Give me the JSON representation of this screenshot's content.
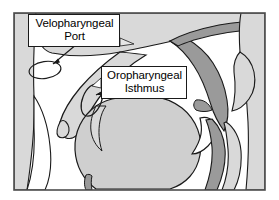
{
  "figure": {
    "frame_color": "#4d4d4d",
    "background_color": "#ffffff"
  },
  "palette": {
    "tissue_light": "#d9d9d9",
    "tissue_mid": "#c9c9c9",
    "tissue_dark": "#9a9a9a",
    "airway_white": "#ffffff",
    "outline": "#1a1a1a",
    "label_text": "#000000",
    "label_border": "#1a1a1a",
    "label_fill": "#ffffff"
  },
  "callouts": [
    {
      "id": "velopharyngeal-port",
      "line1": "Velopharyngeal",
      "line2": "Port"
    },
    {
      "id": "oropharyngeal-isthmus",
      "line1": "Oropharyngeal",
      "line2": "Isthmus"
    }
  ],
  "markers": {
    "velopharyngeal_port_ellipse": "ellipse",
    "oropharyngeal_isthmus_ellipse": "ellipse",
    "velopharyngeal_port_arrow": "arrow",
    "oropharyngeal_isthmus_arrow": "arrow"
  }
}
